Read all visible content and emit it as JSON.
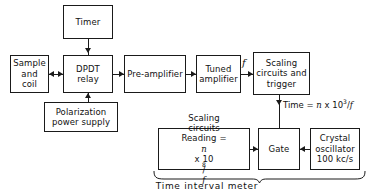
{
  "diagram": {
    "caption": "Time interval meter",
    "line_color": "#1a1a1a",
    "background_color": "#ffffff",
    "boxes": {
      "timer": {
        "label": "Timer"
      },
      "sample_and_coil": {
        "line1": "Sample",
        "line2": "and",
        "line3": "coil"
      },
      "dpdt_relay": {
        "line1": "DPDT",
        "line2": "relay"
      },
      "preamplifier": {
        "label": "Pre-amplifier"
      },
      "tuned_amplifier": {
        "line1": "Tuned",
        "line2": "amplifier"
      },
      "scaling_trigger": {
        "line1": "Scaling",
        "line2": "circuits and",
        "line3": "trigger"
      },
      "polarization_supply": {
        "line1": "Polarization",
        "line2": "power supply"
      },
      "scaling_circuits": {
        "line1": "Scaling",
        "line2": "circuits",
        "line3_prefix": "Reading = ",
        "line3_var": "n",
        "line3_mid": " x 10",
        "line3_exp": "8",
        "line3_div": "/",
        "line3_den": "f"
      },
      "gate": {
        "label": "Gate"
      },
      "crystal_oscillator": {
        "line1": "Crystal",
        "line2": "oscillator",
        "line3": "100 kc/s"
      }
    },
    "annotations": {
      "frequency_label": "f",
      "time_prefix": "Time = ",
      "time_var": "n",
      "time_mid": " x 10",
      "time_exp": "3",
      "time_div": "/",
      "time_den": "f"
    }
  }
}
